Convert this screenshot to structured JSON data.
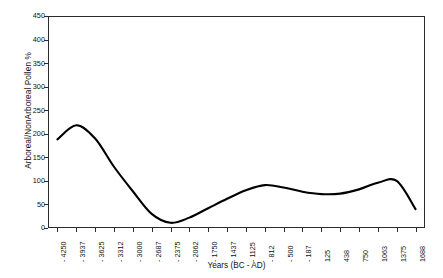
{
  "chart_data": {
    "type": "line",
    "title": "",
    "xlabel": "Years (BC - AD)",
    "ylabel": "Arboreal/NonArboreal Pollen %",
    "ylim": [
      0,
      450
    ],
    "y_ticks": [
      0,
      50,
      100,
      150,
      200,
      250,
      300,
      350,
      400,
      450
    ],
    "y_tick_labels": [
      "0",
      "50",
      "100",
      "150",
      "200",
      "250",
      "300",
      "350",
      "400",
      "450"
    ],
    "grid": false,
    "legend": "none",
    "x_tick_labels": [
      "- 4250",
      "- 3937",
      "- 3625",
      "- 3312",
      "- 3000",
      "- 2687",
      "- 2375",
      "- 2062",
      "- 1750",
      "- 1437",
      "- 1125",
      "- 812",
      "- 500",
      "- 187",
      "125",
      "438",
      "750",
      "1063",
      "1375",
      "1688"
    ],
    "x": [
      -4250,
      -3937,
      -3625,
      -3312,
      -3000,
      -2687,
      -2375,
      -2062,
      -1750,
      -1437,
      -1125,
      -812,
      -500,
      -187,
      125,
      438,
      750,
      1063,
      1375,
      1688
    ],
    "series": [
      {
        "name": "Arboreal/NonArboreal Pollen %",
        "color": "#000000",
        "values": [
          188,
          218,
          190,
          130,
          78,
          30,
          11,
          22,
          42,
          62,
          80,
          91,
          86,
          77,
          72,
          73,
          82,
          96,
          100,
          40
        ]
      }
    ]
  },
  "axes": {
    "x_title": "Years (BC - AD)",
    "y_title": "Arboreal/NonArboreal Pollen %"
  }
}
